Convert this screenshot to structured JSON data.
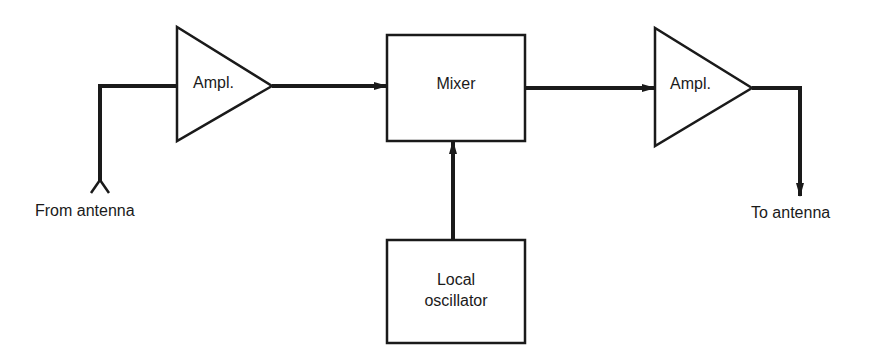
{
  "diagram": {
    "type": "block-diagram",
    "blocks": {
      "amp_in": {
        "label": "Ampl.",
        "shape": "triangle"
      },
      "mixer": {
        "label": "Mixer",
        "shape": "rectangle"
      },
      "amp_out": {
        "label": "Ampl.",
        "shape": "triangle"
      },
      "local_oscillator": {
        "label_line1": "Local",
        "label_line2": "oscillator",
        "shape": "rectangle"
      }
    },
    "terminals": {
      "input": "From antenna",
      "output": "To antenna"
    },
    "connections": [
      {
        "from": "From antenna",
        "to": "Ampl."
      },
      {
        "from": "Ampl.",
        "to": "Mixer"
      },
      {
        "from": "Local oscillator",
        "to": "Mixer"
      },
      {
        "from": "Mixer",
        "to": "Ampl."
      },
      {
        "from": "Ampl.",
        "to": "To antenna"
      }
    ],
    "line_color": "#1a1a1a"
  }
}
